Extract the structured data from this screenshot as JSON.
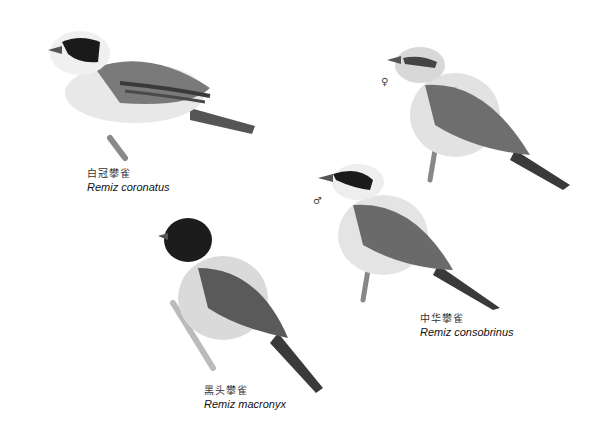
{
  "species": [
    {
      "cn_name": "白冠攀雀",
      "latin_name": "Remiz coronatus"
    },
    {
      "cn_name": "中华攀雀",
      "latin_name": "Remiz consobrinus",
      "sex_marks": [
        "♀",
        "♂"
      ]
    },
    {
      "cn_name": "黑头攀雀",
      "latin_name": "Remiz macronyx"
    }
  ],
  "colors": {
    "background": "#ffffff",
    "mask": "#1a1a1a",
    "back": "#7a7a7a",
    "belly": "#e6e6e6"
  }
}
